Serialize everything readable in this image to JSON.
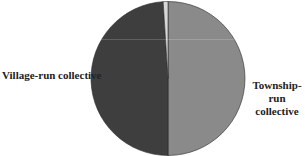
{
  "chart_data": {
    "type": "pie",
    "title": "",
    "slices": [
      {
        "label": "Township-run collective",
        "value": 50.0,
        "color": "#8a8a8a"
      },
      {
        "label": "Village-run collective",
        "value": 49.0,
        "color": "#3e3e3e"
      },
      {
        "label": "",
        "value": 1.0,
        "color": "#d8d8d8"
      }
    ],
    "labels_visible": [
      "Village-run collective",
      "Township-run collective"
    ],
    "legend": "none",
    "start_angle_deg": 0,
    "direction": "clockwise"
  },
  "labels": {
    "village": "Village-run collective",
    "township_line1": "Township-run",
    "township_line2": "collective"
  }
}
